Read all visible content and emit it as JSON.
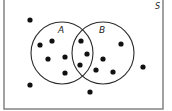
{
  "diagram": {
    "type": "venn",
    "universe": {
      "label": "S",
      "x": 4,
      "y": -2,
      "width": 159,
      "height": 111,
      "label_x": 155,
      "label_y": 9
    },
    "sets": [
      {
        "label": "A",
        "cx": 62,
        "cy": 53,
        "r": 31,
        "label_x": 58,
        "label_y": 33
      },
      {
        "label": "B",
        "cx": 103,
        "cy": 53,
        "r": 31,
        "label_x": 99,
        "label_y": 33
      }
    ],
    "points": [
      {
        "region": "outside",
        "x": 30,
        "y": 20
      },
      {
        "region": "A only",
        "x": 40,
        "y": 45
      },
      {
        "region": "A only",
        "x": 52,
        "y": 41
      },
      {
        "region": "A only",
        "x": 48,
        "y": 59
      },
      {
        "region": "A only",
        "x": 65,
        "y": 57
      },
      {
        "region": "A only",
        "x": 65,
        "y": 73
      },
      {
        "region": "A and B",
        "x": 81,
        "y": 41
      },
      {
        "region": "A and B",
        "x": 87,
        "y": 54
      },
      {
        "region": "A and B",
        "x": 80,
        "y": 65
      },
      {
        "region": "B only",
        "x": 103,
        "y": 59
      },
      {
        "region": "B only",
        "x": 96,
        "y": 70
      },
      {
        "region": "B only",
        "x": 113,
        "y": 72
      },
      {
        "region": "B only",
        "x": 121,
        "y": 44
      },
      {
        "region": "outside",
        "x": 143,
        "y": 67
      },
      {
        "region": "outside",
        "x": 30,
        "y": 85
      },
      {
        "region": "outside",
        "x": 90,
        "y": 92
      }
    ],
    "counts": {
      "A only": 5,
      "A and B": 3,
      "B only": 4,
      "outside": 4,
      "total": 16
    },
    "colors": {
      "frame": "#7a7a7a",
      "circle": "#2a2a2a",
      "dot": "#111111"
    }
  }
}
